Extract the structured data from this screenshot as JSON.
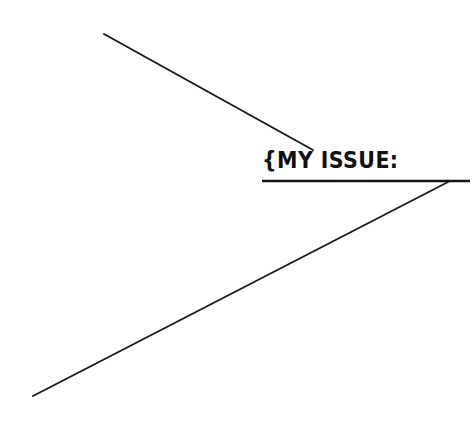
{
  "canvas": {
    "width": 475,
    "height": 437,
    "background_color": "#ffffff",
    "ink_color": "#1a1a1a"
  },
  "label": {
    "text": "{MY ISSUE:",
    "brace": "{",
    "words": "MY ISSUE:",
    "style": "handwritten-marker-caps"
  },
  "chart_data": {
    "type": "diagram",
    "title": "{MY ISSUE:",
    "strokes": [
      {
        "name": "upper-diagonal",
        "kind": "line",
        "x1": 104,
        "y1": 34,
        "x2": 313,
        "y2": 150,
        "width": 1.9,
        "color": "#1a1a1a"
      },
      {
        "name": "lower-diagonal",
        "kind": "line",
        "x1": 33,
        "y1": 396,
        "x2": 448,
        "y2": 182,
        "width": 1.9,
        "color": "#1a1a1a"
      },
      {
        "name": "label-underline",
        "kind": "line",
        "x1": 262,
        "y1": 181,
        "x2": 470,
        "y2": 181,
        "width": 2.4,
        "color": "#141414"
      }
    ],
    "label_box": {
      "text": "{MY ISSUE:",
      "x": 262,
      "y": 150,
      "width": 116,
      "height": 28
    },
    "xlim": [
      0,
      475
    ],
    "ylim": [
      437,
      0
    ],
    "grid": false,
    "legend": false
  }
}
